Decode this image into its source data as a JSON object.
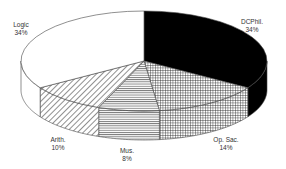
{
  "chart_data": {
    "type": "pie",
    "style": "3d-exploded-none-monochrome-patterns",
    "title": "",
    "start_angle_deg": 0,
    "direction": "clockwise",
    "slices": [
      {
        "label": "DCPhil.",
        "value": 34,
        "percent_label": "34%",
        "fill": "solid-black"
      },
      {
        "label": "Op. Sac.",
        "value": 14,
        "percent_label": "14%",
        "fill": "crosshatch-grid"
      },
      {
        "label": "Mus.",
        "value": 8,
        "percent_label": "8%",
        "fill": "horizontal-lines"
      },
      {
        "label": "Arith.",
        "value": 10,
        "percent_label": "10%",
        "fill": "diagonal-lines"
      },
      {
        "label": "Logic",
        "value": 34,
        "percent_label": "34%",
        "fill": "white"
      }
    ],
    "legend": "none",
    "labels_position": "outside"
  },
  "labels": [
    {
      "name": "DCPhil.",
      "pct": "34%",
      "x": 252,
      "y": 18
    },
    {
      "name": "Op. Sac.",
      "pct": "14%",
      "x": 226,
      "y": 136
    },
    {
      "name": "Mus.",
      "pct": "8%",
      "x": 127,
      "y": 147
    },
    {
      "name": "Arith.",
      "pct": "10%",
      "x": 58,
      "y": 136
    },
    {
      "name": "Logic",
      "pct": "34%",
      "x": 21,
      "y": 21
    }
  ],
  "colors": {
    "outline": "#444444",
    "black": "#000000",
    "white": "#ffffff",
    "pattern_line": "#333333"
  }
}
